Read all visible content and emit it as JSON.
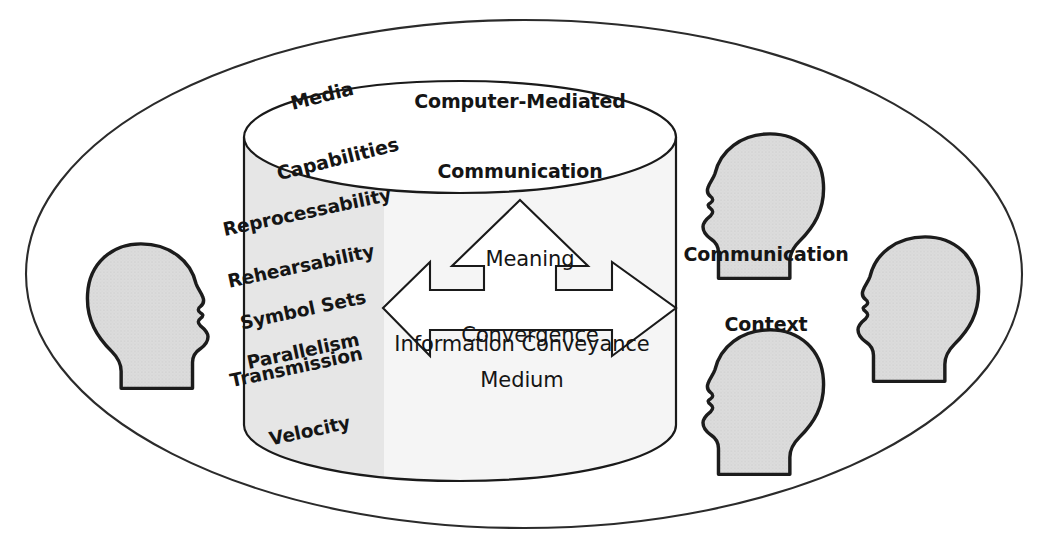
{
  "diagram": {
    "title": "Computer-Mediated Communication",
    "outer_label": "Communication Context",
    "outer_label_lines": [
      "Communication",
      "Context"
    ],
    "cylinder_top_label": "Media Capabilities",
    "cylinder_top_label_lines": [
      "Media",
      "Capabilities"
    ],
    "media_capabilities": [
      "Reprocessability",
      "Rehearsability",
      "Symbol Sets",
      "Parallelism",
      "Transmission Velocity"
    ],
    "media_capability_lines": [
      [
        "Reprocessability"
      ],
      [
        "Rehearsability"
      ],
      [
        "Symbol Sets"
      ],
      [
        "Parallelism"
      ],
      [
        "Transmission",
        "Velocity"
      ]
    ],
    "arrow_labels": {
      "up": "Meaning Convergence",
      "up_lines": [
        "Meaning",
        "Convergence"
      ],
      "horizontal": "Information Conveyance",
      "bottom": "Medium"
    },
    "people_count": 4,
    "people": [
      {
        "name": "person-left",
        "facing": "right"
      },
      {
        "name": "person-top-right",
        "facing": "left"
      },
      {
        "name": "person-bottom-right",
        "facing": "left"
      },
      {
        "name": "person-far-right",
        "facing": "left"
      }
    ],
    "colors": {
      "stroke": "#1a1a1a",
      "outer_ellipse_stroke": "#2b2b2b",
      "cylinder_band_dark": "#e6e6e6",
      "cylinder_band_light": "#f5f5f5",
      "head_fill": "#dcdcdc",
      "head_stroke": "#1c1c1c",
      "background": "#ffffff",
      "text": "#151515"
    }
  }
}
